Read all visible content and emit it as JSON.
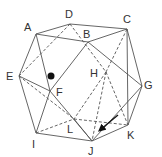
{
  "diagram": {
    "colors": {
      "line": "#555555",
      "label": "#333333",
      "marker": "#111111"
    },
    "vertices": {
      "A": {
        "x": 36,
        "y": 34,
        "label": "A",
        "lx": 24,
        "ly": 31
      },
      "D": {
        "x": 70,
        "y": 24,
        "label": "D",
        "lx": 65,
        "ly": 18
      },
      "C": {
        "x": 127,
        "y": 29,
        "label": "C",
        "lx": 123,
        "ly": 23
      },
      "B": {
        "x": 88,
        "y": 42,
        "label": "B",
        "lx": 83,
        "ly": 38
      },
      "E": {
        "x": 19,
        "y": 76,
        "label": "E",
        "lx": 6,
        "ly": 80
      },
      "F": {
        "x": 50,
        "y": 91,
        "label": "F",
        "lx": 56,
        "ly": 96
      },
      "H": {
        "x": 106,
        "y": 72,
        "label": "H",
        "lx": 90,
        "ly": 77
      },
      "G": {
        "x": 142,
        "y": 86,
        "label": "G",
        "lx": 144,
        "ly": 89
      },
      "I": {
        "x": 36,
        "y": 133,
        "label": "I",
        "lx": 32,
        "ly": 148
      },
      "L": {
        "x": 74,
        "y": 119,
        "label": "L",
        "lx": 67,
        "ly": 133
      },
      "J": {
        "x": 92,
        "y": 141,
        "label": "J",
        "lx": 88,
        "ly": 155
      },
      "K": {
        "x": 128,
        "y": 125,
        "label": "K",
        "lx": 127,
        "ly": 139
      }
    },
    "solid_edges": [
      [
        "A",
        "D"
      ],
      [
        "D",
        "C"
      ],
      [
        "A",
        "B"
      ],
      [
        "B",
        "C"
      ],
      [
        "A",
        "E"
      ],
      [
        "E",
        "I"
      ],
      [
        "I",
        "J"
      ],
      [
        "J",
        "K"
      ],
      [
        "K",
        "G"
      ],
      [
        "G",
        "C"
      ],
      [
        "A",
        "F"
      ],
      [
        "F",
        "I"
      ],
      [
        "B",
        "F"
      ],
      [
        "E",
        "F"
      ],
      [
        "B",
        "G"
      ],
      [
        "C",
        "K"
      ],
      [
        "G",
        "J"
      ],
      [
        "F",
        "J"
      ],
      [
        "L",
        "J"
      ]
    ],
    "dashed_edges": [
      [
        "D",
        "E"
      ],
      [
        "D",
        "H"
      ],
      [
        "C",
        "H"
      ],
      [
        "H",
        "L"
      ],
      [
        "H",
        "K"
      ],
      [
        "I",
        "L"
      ],
      [
        "L",
        "K"
      ],
      [
        "E",
        "L"
      ],
      [
        "H",
        "J"
      ]
    ],
    "marker_dot": {
      "x": 51,
      "y": 76,
      "r": 3.5
    },
    "arrow": {
      "x1": 118,
      "y1": 115,
      "x2": 100,
      "y2": 130
    }
  }
}
